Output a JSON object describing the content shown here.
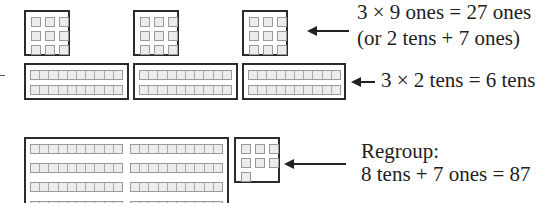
{
  "annotations": {
    "ones_line1": "3 × 9 ones = 27 ones",
    "ones_line2": "(or 2 tens + 7 ones)",
    "tens_label": "3 × 2 tens = 6 tens",
    "regroup_line1": "Regroup:",
    "regroup_line2": "8 tens + 7 ones = 87"
  },
  "blocks": {
    "ones_groups": 3,
    "ones_per_group": 9,
    "tens_groups": 3,
    "tens_per_group": 2,
    "regrouped_tens": 8,
    "regrouped_ones": 7
  },
  "colors": {
    "border": "#2b2b2b",
    "unit_fill": "#ececec",
    "unit_border": "#9a9a9a"
  }
}
